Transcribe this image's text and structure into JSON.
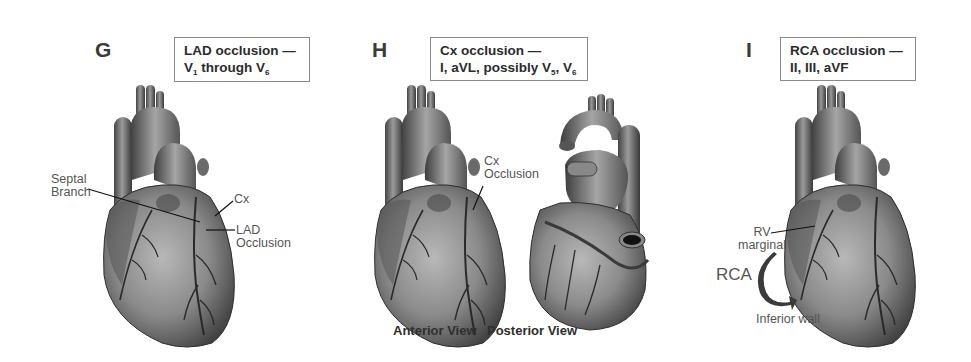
{
  "panels": [
    {
      "letter": "G",
      "caption": {
        "line1": "LAD occlusion —",
        "line2_prefix": "V",
        "line2_sub1": "1",
        "line2_mid": " through V",
        "line2_sub2": "6"
      },
      "labels": {
        "septal_line1": "Septal",
        "septal_line2": "Branch",
        "cx": "Cx",
        "lad_line1": "LAD",
        "lad_line2": "Occlusion"
      }
    },
    {
      "letter": "H",
      "caption": {
        "line1": "Cx occlusion —",
        "line2_prefix": "I, aVL, possibly V",
        "line2_sub1": "5",
        "line2_mid": ", V",
        "line2_sub2": "6"
      },
      "labels": {
        "cx_line1": "Cx",
        "cx_line2": "Occlusion"
      },
      "views": {
        "anterior": "Anterior View",
        "posterior": "Posterior View"
      }
    },
    {
      "letter": "I",
      "caption": {
        "line1": "RCA occlusion —",
        "line2": "II, III, aVF"
      },
      "labels": {
        "rv_line1": "RV",
        "rv_line2": "marginal",
        "rca": "RCA",
        "inferior": "Inferior wall"
      }
    }
  ],
  "icons": {
    "arrow": "curved-arrow-icon"
  },
  "colors": {
    "heart_dark": "#3c3c3c",
    "heart_mid": "#7a7a7a",
    "heart_light": "#b5b5b5",
    "box_border": "#8a8a8a"
  }
}
